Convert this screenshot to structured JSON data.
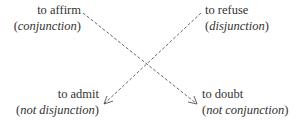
{
  "diagram": {
    "nodes": {
      "top_left": {
        "verb": "to affirm",
        "paren_open": "(",
        "term": "conjunction",
        "paren_close": ")"
      },
      "top_right": {
        "verb": "to refuse",
        "paren_open": "(",
        "term": "disjunction",
        "paren_close": ")"
      },
      "bottom_left": {
        "verb": "to admit",
        "paren_open": "(",
        "term": "not disjunction",
        "paren_close": ")"
      },
      "bottom_right": {
        "verb": "to doubt",
        "paren_open": "(",
        "term": "not conjunction",
        "paren_close": ")"
      }
    },
    "edges": [
      {
        "from": "to affirm",
        "to": "to doubt",
        "style": "dashed",
        "arrow": "end"
      },
      {
        "from": "to refuse",
        "to": "to admit",
        "style": "dashed",
        "arrow": "end"
      }
    ],
    "line_color": "#555555"
  }
}
